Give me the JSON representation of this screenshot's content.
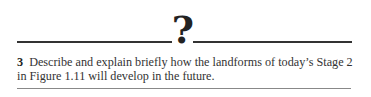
{
  "header": {
    "symbol": "?"
  },
  "question": {
    "number": "3",
    "text": "Describe and explain briefly how the landforms of today’s Stage 2 in Figure 1.11 will develop in the future."
  }
}
